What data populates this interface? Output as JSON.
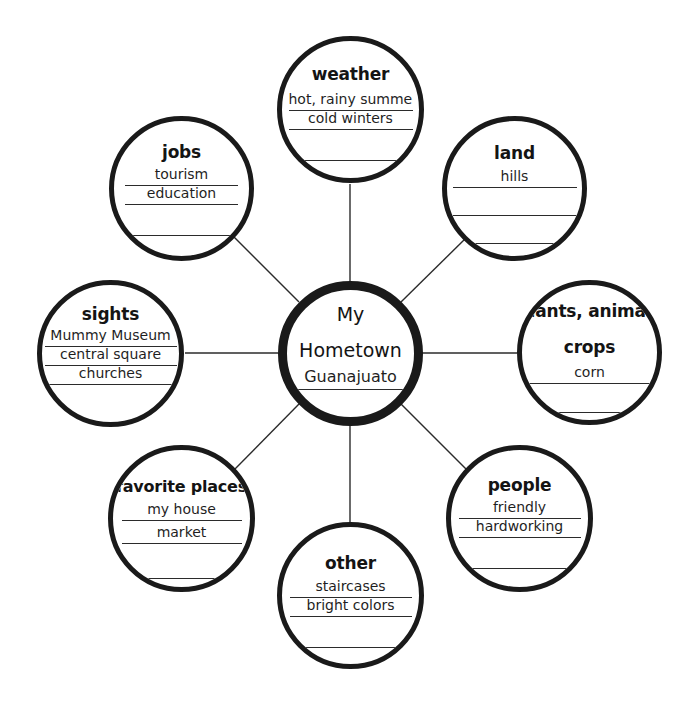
{
  "diagram": {
    "type": "web-cluster-graphic-organizer",
    "center": {
      "title_line1": "My",
      "title_line2": "Hometown",
      "entries": [
        "Guanajuato"
      ]
    },
    "nodes": [
      {
        "id": "weather",
        "title": "weather",
        "title2": "",
        "entries": [
          "hot, rainy summer",
          "cold winters",
          ""
        ]
      },
      {
        "id": "jobs",
        "title": "jobs",
        "title2": "",
        "entries": [
          "tourism",
          "education",
          ""
        ]
      },
      {
        "id": "land",
        "title": "land",
        "title2": "",
        "entries": [
          "hills",
          "",
          ""
        ]
      },
      {
        "id": "sights",
        "title": "sights",
        "title2": "",
        "entries": [
          "Mummy Museum",
          "central square",
          "churches"
        ]
      },
      {
        "id": "plants-animals-crops",
        "title": "plants, animals",
        "title2": "crops",
        "entries": [
          "corn",
          ""
        ]
      },
      {
        "id": "favorite-places",
        "title": "favorite places",
        "title2": "",
        "entries": [
          "my house",
          "market",
          ""
        ]
      },
      {
        "id": "people",
        "title": "people",
        "title2": "",
        "entries": [
          "friendly",
          "hardworking",
          ""
        ]
      },
      {
        "id": "other",
        "title": "other",
        "title2": "",
        "entries": [
          "staircases",
          "bright colors",
          ""
        ]
      }
    ],
    "colors": {
      "ink": "#1a1a1a",
      "line": "#2b2b2b",
      "background": "#ffffff"
    }
  }
}
